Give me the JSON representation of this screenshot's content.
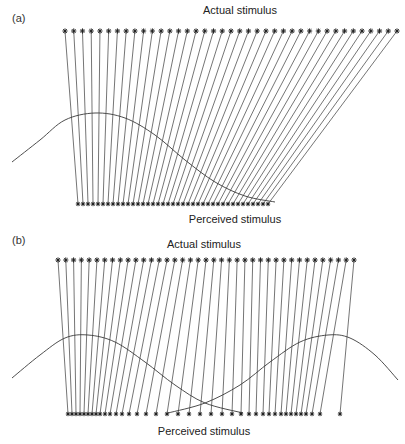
{
  "panels": [
    {
      "label": "(a)",
      "top_title": "Actual stimulus",
      "bottom_title": "Perceived stimulus",
      "actual_row": {
        "y": 31,
        "x_start": 65,
        "x_end": 397,
        "count": 39
      },
      "perceived_row": {
        "y": 204,
        "x_start": 78,
        "x_end": 268,
        "count": 39
      },
      "curves": [
        {
          "name": "attention-gaussian",
          "points": [
            [
              12,
              162
            ],
            [
              40,
              140
            ],
            [
              65,
              120
            ],
            [
              95,
              113
            ],
            [
              125,
              118
            ],
            [
              155,
              135
            ],
            [
              185,
              160
            ],
            [
              215,
              182
            ],
            [
              245,
              196
            ],
            [
              275,
              202
            ]
          ]
        }
      ]
    },
    {
      "label": "(b)",
      "top_title": "Actual stimulus",
      "bottom_title": "Perceived stimulus",
      "actual_row": {
        "y": 260,
        "x_start": 58,
        "x_end": 354,
        "count": 39
      },
      "perceived_row": {
        "y": 414,
        "positions": [
          68,
          72,
          76,
          80,
          84,
          88,
          92,
          96,
          100,
          105,
          110,
          116,
          122,
          129,
          137,
          146,
          156,
          167,
          178,
          189,
          200,
          211,
          222,
          232,
          241,
          249,
          256,
          263,
          269,
          275,
          281,
          286,
          291,
          296,
          301,
          306,
          312,
          320,
          340
        ]
      },
      "curves": [
        {
          "name": "attention-gaussian-left",
          "points": [
            [
              12,
              378
            ],
            [
              40,
              355
            ],
            [
              65,
              338
            ],
            [
              88,
              335
            ],
            [
              115,
              342
            ],
            [
              145,
              362
            ],
            [
              175,
              385
            ],
            [
              205,
              403
            ],
            [
              243,
              413
            ]
          ]
        },
        {
          "name": "attention-gaussian-right",
          "points": [
            [
              168,
              413
            ],
            [
              205,
              403
            ],
            [
              240,
              385
            ],
            [
              270,
              362
            ],
            [
              300,
              342
            ],
            [
              328,
              335
            ],
            [
              350,
              338
            ],
            [
              375,
              355
            ],
            [
              398,
              380
            ]
          ]
        }
      ]
    }
  ],
  "style": {
    "line_color": "#3a3a3a",
    "star_color": "#222222",
    "background": "#ffffff"
  }
}
